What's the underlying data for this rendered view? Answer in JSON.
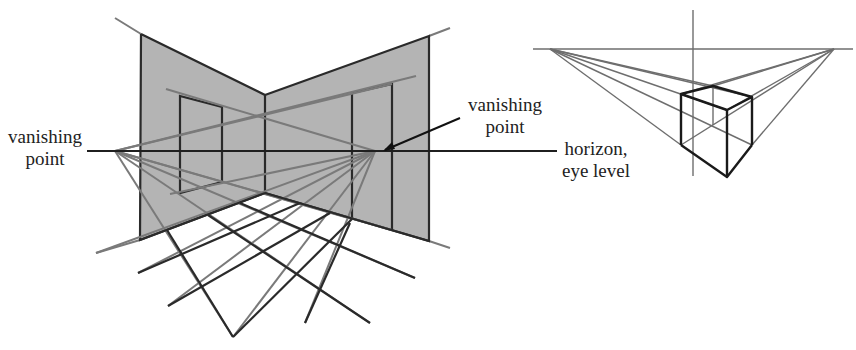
{
  "left_figure": {
    "title": "two-point perspective room",
    "labels": {
      "left_vp": [
        "vanishing",
        "point"
      ],
      "right_vp": [
        "vanishing",
        "point"
      ],
      "horizon": [
        "horizon,",
        "eye level"
      ]
    }
  },
  "right_figure": {
    "title": "two-point perspective cube"
  },
  "colors": {
    "wall_fill": "#b4b4b4",
    "construction_line": "#7a7a7a",
    "edge_line": "#2a2a2a",
    "background": "#ffffff"
  }
}
